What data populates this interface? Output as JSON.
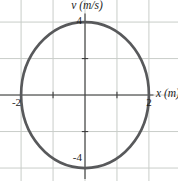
{
  "figure": {
    "ylabel": "v (m/s)",
    "xlabel": "x (m)",
    "tick_labels": {
      "v_top": "4",
      "v_bottom": "-4",
      "x_left": "-2",
      "x_right": "2"
    }
  },
  "colors": {
    "background": "#ffffff",
    "grid": "#c9cdc9",
    "axis": "#3d3d3d",
    "tick": "#3d3d3d",
    "curve": "#58595b",
    "text": "#1c1c1c"
  },
  "chart_data": {
    "type": "line",
    "title": "",
    "xlabel": "x (m)",
    "ylabel": "v (m/s)",
    "x_amplitude_m": 2,
    "v_amplitude_ms": 4,
    "xlim": [
      -2.66,
      2.91
    ],
    "vlim": [
      -4.71,
      5.21
    ],
    "x_grid_step": 1,
    "v_grid_step": 2,
    "grid": true,
    "x_ticks": [
      -2,
      -1,
      1,
      2
    ],
    "v_ticks": [
      -4,
      -2,
      2,
      4
    ],
    "x_tick_labels": [
      {
        "value": -2,
        "label": "-2"
      },
      {
        "value": 2,
        "label": "2"
      }
    ],
    "v_tick_labels": [
      {
        "value": 4,
        "label": "4"
      },
      {
        "value": -4,
        "label": "-4"
      }
    ],
    "series": [
      {
        "name": "v-x ellipse",
        "parametric": "x = 2cos(theta), v = 4sin(theta)",
        "key_points_x_v": [
          [
            2,
            0
          ],
          [
            0,
            4
          ],
          [
            -2,
            0
          ],
          [
            0,
            -4
          ]
        ]
      }
    ],
    "legend": false
  }
}
